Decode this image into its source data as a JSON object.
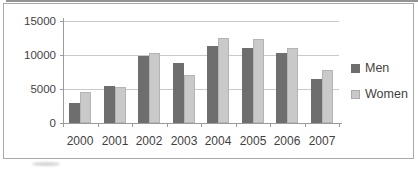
{
  "chart_data": {
    "type": "bar",
    "title": "",
    "xlabel": "",
    "ylabel": "",
    "categories": [
      "2000",
      "2001",
      "2002",
      "2003",
      "2004",
      "2005",
      "2006",
      "2007"
    ],
    "series": [
      {
        "name": "Men",
        "color": "#6e6e6e",
        "values": [
          3000,
          5500,
          9800,
          8800,
          11300,
          11100,
          10300,
          6500
        ]
      },
      {
        "name": "Women",
        "color": "#c9c9c9",
        "values": [
          4500,
          5300,
          10300,
          7000,
          12500,
          12400,
          11000,
          7800
        ]
      }
    ],
    "ylim": [
      0,
      15000
    ],
    "ytick_interval": 5000,
    "ytick_labels": [
      "0",
      "5000",
      "10000",
      "15000"
    ],
    "grid": true,
    "legend_position": "right",
    "legend_entries": [
      "Men",
      "Women"
    ]
  },
  "colors": {
    "grid": "#c9c9c9",
    "axis": "#9b9b9b",
    "text": "#3f3f3f",
    "frame_border": "#a9a9a9"
  }
}
